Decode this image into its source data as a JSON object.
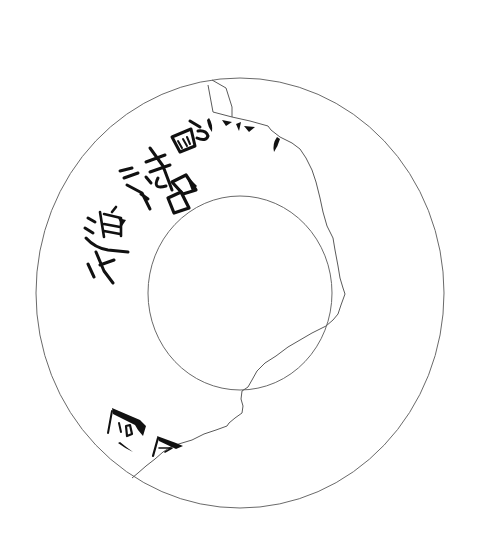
{
  "figure": {
    "type": "line drawing of a broken inscribed disc",
    "colors": {
      "background": "#ffffff",
      "outline": "#6a6a6a",
      "ink": "#111111"
    },
    "outer_rim": {
      "cx": 240,
      "cy": 293,
      "rx": 204,
      "ry": 215
    },
    "inner_hole": {
      "cx": 240,
      "cy": 293,
      "rx": 92,
      "ry": 97
    },
    "inscription": {
      "upper_arc": [
        {
          "char": "丶",
          "x": 268,
          "y": 128,
          "rotate": 40,
          "size": 16
        },
        {
          "char": "灬",
          "x": 238,
          "y": 124,
          "rotate": 20,
          "size": 18
        },
        {
          "char": "ろ",
          "x": 205,
          "y": 128,
          "rotate": 15,
          "size": 22
        },
        {
          "char": "画",
          "x": 178,
          "y": 143,
          "rotate": 25,
          "size": 22
        },
        {
          "char": "も",
          "x": 160,
          "y": 163,
          "rotate": 35,
          "size": 26
        },
        {
          "char": "名",
          "x": 176,
          "y": 195,
          "rotate": 20,
          "size": 26
        },
        {
          "char": "汁",
          "x": 127,
          "y": 187,
          "rotate": 40,
          "size": 26
        },
        {
          "char": "進",
          "x": 107,
          "y": 233,
          "rotate": 55,
          "size": 28
        },
        {
          "char": "上",
          "x": 101,
          "y": 271,
          "rotate": 65,
          "size": 26
        }
      ],
      "lower_fragment": [
        {
          "char": "回",
          "x": 125,
          "y": 428,
          "rotate": 110,
          "size": 28
        },
        {
          "char": "冂",
          "x": 160,
          "y": 443,
          "rotate": 100,
          "size": 24
        }
      ]
    }
  }
}
